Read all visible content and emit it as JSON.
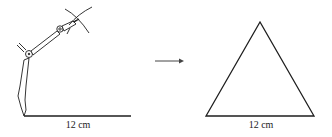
{
  "figure": {
    "left_panel": {
      "description": "compass drawing arcs from ends of a line segment",
      "segment_label": "12 cm"
    },
    "arrow": {
      "direction": "right"
    },
    "right_panel": {
      "description": "equilateral triangle",
      "base_label": "12 cm"
    }
  },
  "colors": {
    "stroke": "#1e1e1e",
    "background": "#ffffff"
  }
}
